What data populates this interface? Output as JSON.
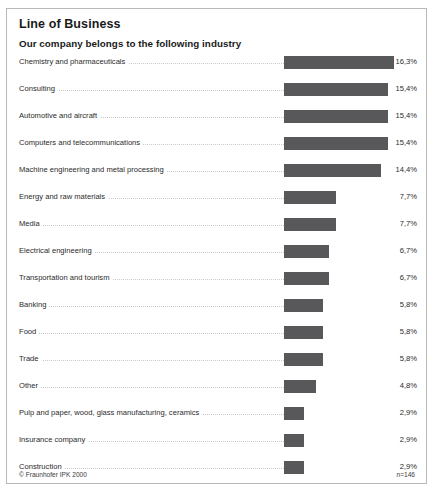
{
  "header": {
    "title": "Line of Business",
    "subtitle": "Our company belongs to the following industry"
  },
  "footer": {
    "copyright": "© Fraunhofer IPK 2000",
    "sample_size": "n=146"
  },
  "colors": {
    "bar": "#58585a",
    "frame": "#b8b8b8",
    "leader": "#c9c9c9",
    "text": "#2b2b2b",
    "background": "#ffffff"
  },
  "chart_data": {
    "type": "bar",
    "orientation": "horizontal",
    "title": "Line of Business",
    "subtitle": "Our company belongs to the following industry",
    "xlabel": "",
    "ylabel": "",
    "xlim": [
      0,
      17
    ],
    "grid": false,
    "legend": false,
    "note": "n=146",
    "value_suffix": "%",
    "decimal_separator": ",",
    "categories": [
      "Chemistry and pharmaceuticals",
      "Consulting",
      "Automotive and aircraft",
      "Computers and telecommunications",
      "Machine engineering and metal processing",
      "Energy and raw materials",
      "Media",
      "Electrical engineering",
      "Transportation and tourism",
      "Banking",
      "Food",
      "Trade",
      "Other",
      "Pulp and paper, wood, glass manufacturing, ceramics",
      "Insurance company",
      "Construction",
      "Textile, shoes, clothing",
      "Mixed corporation"
    ],
    "values": [
      16.3,
      15.4,
      15.4,
      15.4,
      14.4,
      7.7,
      7.7,
      6.7,
      6.7,
      5.8,
      5.8,
      5.8,
      4.8,
      2.9,
      2.9,
      2.9,
      1.9,
      1.9
    ],
    "value_labels": [
      "16,3%",
      "15,4%",
      "15,4%",
      "15,4%",
      "14,4%",
      "7,7%",
      "7,7%",
      "6,7%",
      "6,7%",
      "5,8%",
      "5,8%",
      "5,8%",
      "4,8%",
      "2,9%",
      "2,9%",
      "2,9%",
      "1,9%",
      "1,9%"
    ]
  }
}
